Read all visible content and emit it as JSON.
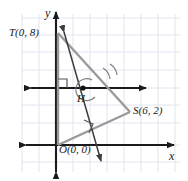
{
  "figure": {
    "kind": "coordinate-geometry-diagram",
    "background": "#ffffff",
    "grid_color": "#dfe4ef",
    "axis_color": "#1a1a1a",
    "triangle_color": "#9a9a9a",
    "transversal_color": "#3c3c3c",
    "labels": {
      "x_axis": "x",
      "y_axis": "y",
      "point_T": "T(0, 8)",
      "point_S": "S(6, 2)",
      "point_O": "O(0, 0)",
      "point_H": "H"
    },
    "points": {
      "T": [
        0,
        8
      ],
      "S": [
        6,
        2
      ],
      "O": [
        0,
        0
      ],
      "H": null
    },
    "marks": {
      "right_angle_at_H_left": true,
      "right_angle_on_OS": true,
      "angle_arcs_near_H": 2
    },
    "segments": [
      "T-S",
      "T-O",
      "O-S"
    ],
    "rays": [
      "horizontal-through-H",
      "transversal-through-T-and-H"
    ]
  }
}
